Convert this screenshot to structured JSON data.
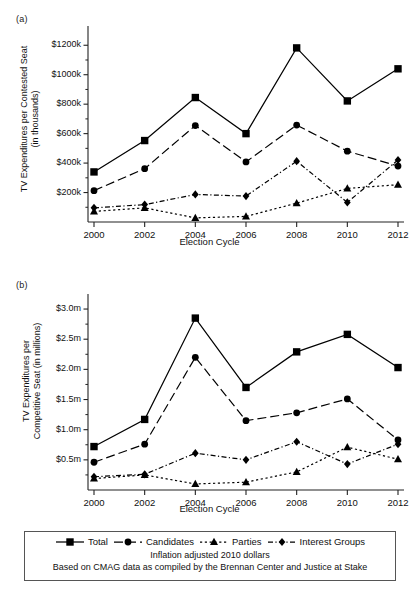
{
  "figure": {
    "panel_a_tag": "(a)",
    "panel_b_tag": "(b)",
    "legend": [
      {
        "label": "Total",
        "marker": "square",
        "dash": "solid"
      },
      {
        "label": "Candidates",
        "marker": "circle",
        "dash": "long-dash"
      },
      {
        "label": "Parties",
        "marker": "triangle",
        "dash": "dotted"
      },
      {
        "label": "Interest Groups",
        "marker": "diamond",
        "dash": "dash-dot"
      }
    ],
    "note_line_1": "Inflation adjusted 2010 dollars",
    "note_line_2": "Based on CMAG data as compiled by the Brennan Center and Justice at Stake"
  },
  "chart_data": [
    {
      "type": "line",
      "panel": "(a)",
      "title": "",
      "xlabel": "Election Cycle",
      "ylabel": "TV Expenditures per Contested Seat\n(in thousands)",
      "ylabel_line1": "TV Expenditures per Contested Seat",
      "ylabel_line2": "(in thousands)",
      "categories": [
        2000,
        2002,
        2004,
        2006,
        2008,
        2010,
        2012
      ],
      "xticklabels": [
        "2000",
        "2002",
        "2004",
        "2006",
        "2008",
        "2010",
        "2012"
      ],
      "yticklabels": [
        "$200k",
        "$400k",
        "$600k",
        "$800k",
        "$1000k",
        "$1200k"
      ],
      "ytickvalues": [
        200,
        400,
        600,
        800,
        1000,
        1200
      ],
      "ylim": [
        0,
        1290
      ],
      "xlim": [
        1999,
        2013
      ],
      "grid": false,
      "units": "thousands of dollars",
      "series": [
        {
          "name": "Total",
          "marker": "square",
          "dash": "solid",
          "values": [
            340,
            553,
            845,
            600,
            1182,
            822,
            1040
          ]
        },
        {
          "name": "Candidates",
          "marker": "circle",
          "dash": "long-dash",
          "values": [
            213,
            362,
            655,
            408,
            658,
            481,
            380
          ]
        },
        {
          "name": "Parties",
          "marker": "triangle",
          "dash": "dotted",
          "values": [
            72,
            96,
            28,
            38,
            128,
            228,
            253
          ]
        },
        {
          "name": "Interest Groups",
          "marker": "diamond",
          "dash": "dash-dot",
          "values": [
            96,
            118,
            187,
            176,
            413,
            133,
            421
          ]
        }
      ]
    },
    {
      "type": "line",
      "panel": "(b)",
      "title": "",
      "xlabel": "Election Cycle",
      "ylabel": "TV Expenditures per Competitive Seat (in millions)",
      "ylabel_line1": "TV Expenditures per",
      "ylabel_line2": "Competitive Seat (in millions)",
      "categories": [
        2000,
        2002,
        2004,
        2006,
        2008,
        2010,
        2012
      ],
      "xticklabels": [
        "2000",
        "2002",
        "2004",
        "2006",
        "2008",
        "2010",
        "2012"
      ],
      "yticklabels": [
        "$0.5m",
        "$1.0m",
        "$1.5m",
        "$2.0m",
        "$2.5m",
        "$3.0m"
      ],
      "ytickvalues": [
        0.5,
        1.0,
        1.5,
        2.0,
        2.5,
        3.0
      ],
      "ylim": [
        0,
        3.15
      ],
      "xlim": [
        1999,
        2013
      ],
      "grid": false,
      "units": "millions of dollars",
      "series": [
        {
          "name": "Total",
          "marker": "square",
          "dash": "solid",
          "values": [
            0.72,
            1.17,
            2.85,
            1.7,
            2.29,
            2.58,
            2.03
          ]
        },
        {
          "name": "Candidates",
          "marker": "circle",
          "dash": "long-dash",
          "values": [
            0.46,
            0.76,
            2.2,
            1.15,
            1.28,
            1.51,
            0.83
          ]
        },
        {
          "name": "Parties",
          "marker": "triangle",
          "dash": "dotted",
          "values": [
            0.19,
            0.25,
            0.1,
            0.13,
            0.3,
            0.71,
            0.51
          ]
        },
        {
          "name": "Interest Groups",
          "marker": "diamond",
          "dash": "dash-dot",
          "values": [
            0.22,
            0.26,
            0.61,
            0.5,
            0.8,
            0.43,
            0.76
          ]
        }
      ]
    }
  ]
}
